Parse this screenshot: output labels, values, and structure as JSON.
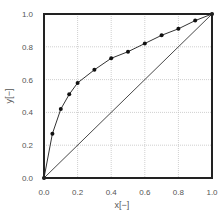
{
  "chart_data": {
    "type": "line",
    "title": "",
    "xlabel": "x[−]",
    "ylabel": "y[−]",
    "xlim": [
      0,
      1.0
    ],
    "ylim": [
      0,
      1.0
    ],
    "grid": true,
    "legend": null,
    "x_ticks": [
      "0.0",
      "0.2",
      "0.4",
      "0.6",
      "0.8",
      "1.0"
    ],
    "y_ticks": [
      "0.0",
      "0.2",
      "0.4",
      "0.6",
      "0.8",
      "1.0"
    ],
    "series": [
      {
        "name": "equilibrium curve",
        "style": "line-with-markers",
        "color": "#333333",
        "x": [
          0.0,
          0.05,
          0.1,
          0.15,
          0.2,
          0.3,
          0.4,
          0.5,
          0.6,
          0.7,
          0.8,
          0.9,
          1.0
        ],
        "y": [
          0.0,
          0.27,
          0.42,
          0.51,
          0.58,
          0.66,
          0.73,
          0.77,
          0.82,
          0.87,
          0.91,
          0.96,
          1.0
        ]
      },
      {
        "name": "diagonal y=x",
        "style": "line",
        "color": "#333333",
        "x": [
          0.0,
          1.0
        ],
        "y": [
          0.0,
          1.0
        ]
      }
    ]
  },
  "colors": {
    "axis": "#222222",
    "grid": "#bbbbbb",
    "line": "#333333",
    "marker": "#111111",
    "text": "#555555"
  }
}
